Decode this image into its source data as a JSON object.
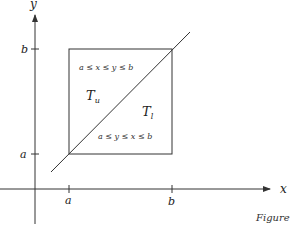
{
  "diagram": {
    "axes": {
      "x_label": "x",
      "y_label": "y",
      "x_ticks": [
        "a",
        "b"
      ],
      "y_ticks": [
        "a",
        "b"
      ]
    },
    "regions": {
      "upper": {
        "name": "T",
        "subscript": "u",
        "condition": "a ≤ x ≤ y ≤ b"
      },
      "lower": {
        "name": "T",
        "subscript": "l",
        "condition": "a ≤ y ≤ x ≤ b"
      }
    },
    "diagonal_label": "y = x",
    "caption": "Figure"
  },
  "colors": {
    "stroke": "#333333",
    "background": "#ffffff"
  }
}
